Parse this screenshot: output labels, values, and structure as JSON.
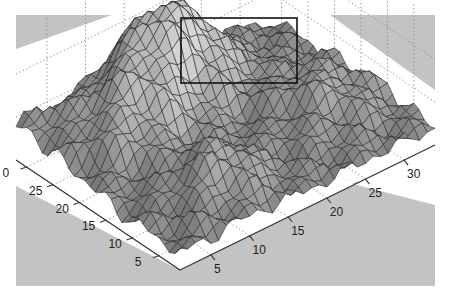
{
  "chart_data": {
    "type": "surface",
    "title": "",
    "xlabel": "",
    "ylabel": "",
    "zlabel": "",
    "grid": true,
    "grid_style": "dotted",
    "colormap": "gray",
    "x_axis": {
      "ticks": [
        5,
        10,
        15,
        20,
        25,
        30
      ],
      "tick_labels": [
        "5",
        "10",
        "15",
        "20",
        "25",
        "30"
      ],
      "range": [
        1,
        34
      ]
    },
    "y_axis": {
      "ticks": [
        5,
        10,
        15,
        20,
        25,
        30
      ],
      "tick_labels": [
        "5",
        "10",
        "15",
        "20",
        "25",
        "30"
      ],
      "visible_tick_labels": [
        "5",
        "10",
        "15",
        "20",
        "25",
        "0"
      ],
      "range": [
        1,
        32
      ]
    },
    "annotations": [
      {
        "type": "rectangle",
        "description": "highlight box around surface peak",
        "x": 181,
        "y": 18,
        "width": 116,
        "height": 65,
        "color": "#111111"
      }
    ],
    "background_color": "#c3c3c3",
    "plane_color": "#ffffff",
    "surface_description": "Rugged terrain-like surface with a large central peak near the back, secondary ridges on the left, and lower valleys toward the front corner."
  },
  "labels": {
    "left_axis": [
      "0",
      "25",
      "20",
      "15",
      "10",
      "5"
    ],
    "right_axis": [
      "5",
      "10",
      "15",
      "20",
      "25",
      "30"
    ]
  }
}
